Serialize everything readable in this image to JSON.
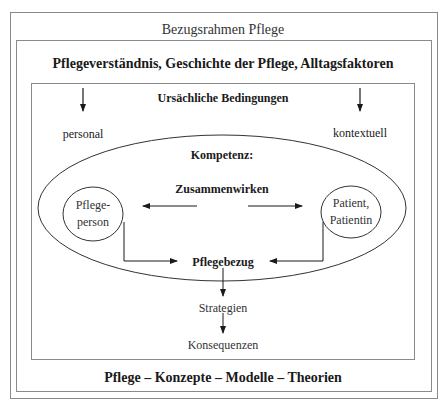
{
  "diagram": {
    "outer_title": "Bezugsrahmen Pflege",
    "middle_header": "Pflegeverständnis, Geschichte der Pflege, Alltagsfaktoren",
    "inner_header": "Ursächliche Bedingungen",
    "left_condition": "personal",
    "right_condition": "kontextuell",
    "ellipse_title": "Kompetenz:",
    "interaction_label": "Zusammenwirken",
    "left_node": {
      "line1": "Pflege-",
      "line2": "person"
    },
    "right_node": {
      "line1": "Patient,",
      "line2": "Patientin"
    },
    "center_node": "Pflegebezug",
    "step1": "Strategien",
    "step2": "Konsequenzen",
    "footer": "Pflege – Konzepte – Modelle – Theorien"
  },
  "colors": {
    "line": "#1a1a1a",
    "frame": "#8a8a8a"
  }
}
